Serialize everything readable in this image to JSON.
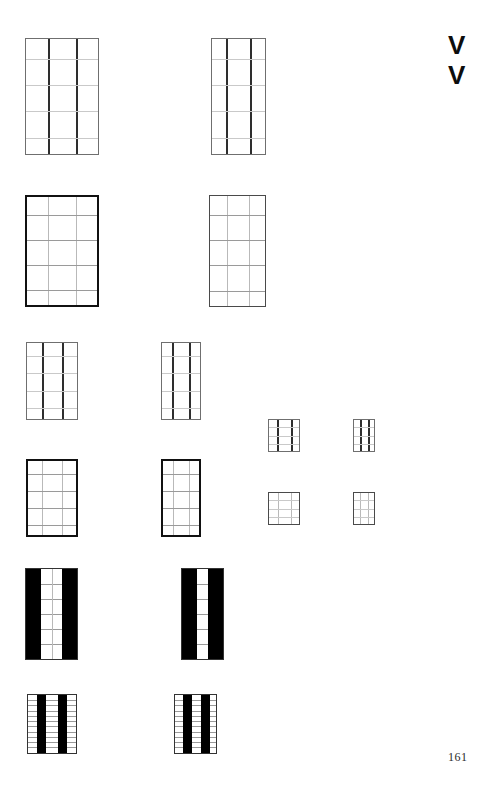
{
  "page": {
    "page_number": "161",
    "width": 487,
    "height": 800,
    "background_color": "#ffffff"
  },
  "margin_marks": {
    "top_mark_1": "V",
    "top_mark_2": "V",
    "color": "#0d0d0d"
  },
  "figures": [
    {
      "id": "fig-r1-c1",
      "label": "rectangular grid plan, 3 bays wide, 5 courses high",
      "x": 25,
      "y": 38,
      "w": 74,
      "h": 117,
      "border": "thin",
      "vertical_lines": [
        0.3,
        0.7
      ],
      "vertical_weight": "dark",
      "horizontal_lines": [
        0.17,
        0.4,
        0.63,
        0.86
      ],
      "horizontal_weight": "light"
    },
    {
      "id": "fig-r1-c2",
      "label": "rectangular grid plan, narrow, 3 bays wide, 5 courses high",
      "x": 211,
      "y": 38,
      "w": 55,
      "h": 117,
      "border": "thin",
      "vertical_lines": [
        0.26,
        0.72
      ],
      "vertical_weight": "dark",
      "horizontal_lines": [
        0.17,
        0.4,
        0.63,
        0.86
      ],
      "horizontal_weight": "light"
    },
    {
      "id": "fig-r2-c1",
      "label": "bold-outline rectangular grid, 3 bays wide, 5 courses high",
      "x": 25,
      "y": 195,
      "w": 74,
      "h": 112,
      "border": "thick",
      "vertical_lines": [
        0.3,
        0.7
      ],
      "vertical_weight": "light",
      "horizontal_lines": [
        0.17,
        0.4,
        0.63,
        0.86
      ],
      "horizontal_weight": "med"
    },
    {
      "id": "fig-r2-c2",
      "label": "bold-outline rectangular grid, narrow, 3 bays wide, 5 courses high",
      "x": 209,
      "y": 195,
      "w": 57,
      "h": 112,
      "border": "med",
      "vertical_lines": [
        0.3,
        0.7
      ],
      "vertical_weight": "light",
      "horizontal_lines": [
        0.17,
        0.4,
        0.63,
        0.86
      ],
      "horizontal_weight": "med"
    },
    {
      "id": "fig-r3-c1",
      "label": "medium rectangular grid, 3 bays wide, 5 courses high",
      "x": 26,
      "y": 342,
      "w": 52,
      "h": 78,
      "border": "thin",
      "vertical_lines": [
        0.3,
        0.7
      ],
      "vertical_weight": "dark",
      "horizontal_lines": [
        0.17,
        0.4,
        0.63,
        0.86
      ],
      "horizontal_weight": "light"
    },
    {
      "id": "fig-r3-c2",
      "label": "medium rectangular grid, narrow, 3 bays wide, 5 courses high",
      "x": 161,
      "y": 342,
      "w": 40,
      "h": 78,
      "border": "thin",
      "vertical_lines": [
        0.27,
        0.72
      ],
      "vertical_weight": "dark",
      "horizontal_lines": [
        0.17,
        0.4,
        0.63,
        0.86
      ],
      "horizontal_weight": "light"
    },
    {
      "id": "fig-r3-c3",
      "label": "small rectangular grid, 3 bays wide, 4 courses high",
      "x": 268,
      "y": 419,
      "w": 32,
      "h": 33,
      "border": "thin",
      "vertical_lines": [
        0.27,
        0.72
      ],
      "vertical_weight": "dark",
      "horizontal_lines": [
        0.22,
        0.5,
        0.78
      ],
      "horizontal_weight": "light"
    },
    {
      "id": "fig-r3-c4",
      "label": "small rectangular grid, narrow, 3 bays wide, 4 courses high",
      "x": 353,
      "y": 419,
      "w": 22,
      "h": 33,
      "border": "thin",
      "vertical_lines": [
        0.28,
        0.72
      ],
      "vertical_weight": "dark",
      "horizontal_lines": [
        0.22,
        0.5,
        0.78
      ],
      "horizontal_weight": "light"
    },
    {
      "id": "fig-r4-c1",
      "label": "bold-outline medium grid, 3 bays wide, 5 courses high",
      "x": 26,
      "y": 459,
      "w": 52,
      "h": 78,
      "border": "thick",
      "vertical_lines": [
        0.3,
        0.7
      ],
      "vertical_weight": "light",
      "horizontal_lines": [
        0.17,
        0.4,
        0.63,
        0.86
      ],
      "horizontal_weight": "med"
    },
    {
      "id": "fig-r4-c2",
      "label": "bold-outline medium grid, narrow, 3 bays wide, 5 courses high",
      "x": 161,
      "y": 459,
      "w": 40,
      "h": 78,
      "border": "thick",
      "vertical_lines": [
        0.28,
        0.72
      ],
      "vertical_weight": "light",
      "horizontal_lines": [
        0.17,
        0.4,
        0.63,
        0.86
      ],
      "horizontal_weight": "med"
    },
    {
      "id": "fig-r4-c3",
      "label": "small bold-outline grid, 3 bays wide, 4 courses high",
      "x": 268,
      "y": 492,
      "w": 32,
      "h": 33,
      "border": "med",
      "vertical_lines": [
        0.3,
        0.72
      ],
      "vertical_weight": "light",
      "horizontal_lines": [
        0.22,
        0.5,
        0.78
      ],
      "horizontal_weight": "light"
    },
    {
      "id": "fig-r4-c4",
      "label": "small bold-outline grid, narrow, 3 bays wide, 4 courses high",
      "x": 353,
      "y": 492,
      "w": 22,
      "h": 33,
      "border": "med",
      "vertical_lines": [
        0.3,
        0.72
      ],
      "vertical_weight": "light",
      "horizontal_lines": [
        0.22,
        0.5,
        0.78
      ],
      "horizontal_weight": "light"
    }
  ],
  "solid_figures": [
    {
      "id": "fig-r5-c1",
      "label": "filled plan with two solid black outer piers and gridded central bay",
      "x": 25,
      "y": 568,
      "w": 53,
      "h": 92,
      "bands": [
        {
          "left": 0.0,
          "width": 0.3
        },
        {
          "left": 0.7,
          "width": 0.3
        }
      ],
      "vertical_lines": [
        0.5
      ],
      "horizontal_lines": [
        0.165,
        0.33,
        0.5,
        0.665,
        0.83
      ],
      "fill_color": "#000000"
    },
    {
      "id": "fig-r5-c2",
      "label": "filled plan with two solid black outer piers and narrow gridded central bay",
      "x": 181,
      "y": 568,
      "w": 43,
      "h": 92,
      "bands": [
        {
          "left": 0.0,
          "width": 0.36
        },
        {
          "left": 0.64,
          "width": 0.36
        }
      ],
      "vertical_lines": [],
      "horizontal_lines": [
        0.165,
        0.33,
        0.5,
        0.665,
        0.83
      ],
      "fill_color": "#000000"
    },
    {
      "id": "fig-r6-c1",
      "label": "filled plan with two interior solid black piers, fine horizontal coursing",
      "x": 27,
      "y": 694,
      "w": 50,
      "h": 60,
      "bands": [
        {
          "left": 0.18,
          "width": 0.2
        },
        {
          "left": 0.62,
          "width": 0.2
        }
      ],
      "vertical_lines": [],
      "horizontal_lines": [
        0.09,
        0.18,
        0.27,
        0.36,
        0.45,
        0.54,
        0.63,
        0.72,
        0.81,
        0.9
      ],
      "fill_color": "#000000"
    },
    {
      "id": "fig-r6-c2",
      "label": "filled plan with two interior solid black piers, narrow, fine horizontal coursing",
      "x": 174,
      "y": 694,
      "w": 43,
      "h": 60,
      "bands": [
        {
          "left": 0.19,
          "width": 0.22
        },
        {
          "left": 0.64,
          "width": 0.22
        }
      ],
      "vertical_lines": [],
      "horizontal_lines": [
        0.09,
        0.18,
        0.27,
        0.36,
        0.45,
        0.54,
        0.63,
        0.72,
        0.81,
        0.9
      ],
      "fill_color": "#000000"
    }
  ]
}
